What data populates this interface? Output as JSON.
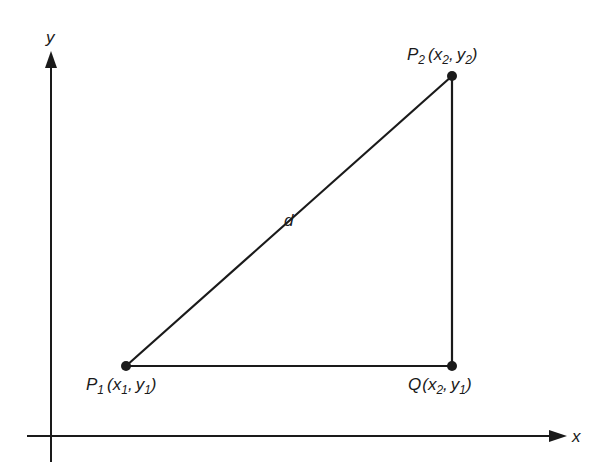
{
  "axes": {
    "x_label": "x",
    "y_label": "y"
  },
  "points": {
    "p1": {
      "name": "P",
      "sub": "1",
      "coord_open": "(",
      "coord_x": "x",
      "coord_x_sub": "1",
      "sep": ",",
      "coord_y": "y",
      "coord_y_sub": "1",
      "coord_close": ")"
    },
    "p2": {
      "name": "P",
      "sub": "2",
      "coord_open": "(",
      "coord_x": "x",
      "coord_x_sub": "2",
      "sep": ",",
      "coord_y": "y",
      "coord_y_sub": "2",
      "coord_close": ")"
    },
    "q": {
      "name": "Q",
      "coord_open": "(",
      "coord_x": "x",
      "coord_x_sub": "2",
      "sep": ",",
      "coord_y": "y",
      "coord_y_sub": "1",
      "coord_close": ")"
    }
  },
  "segments": {
    "hypotenuse_label": "d"
  },
  "colors": {
    "ink": "#1a1a1a",
    "background": "#ffffff"
  }
}
